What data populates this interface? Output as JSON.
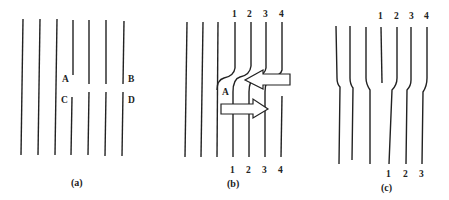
{
  "panels": [
    {
      "id": "a",
      "caption": "(a)",
      "point_labels": {
        "A": "A",
        "B": "B",
        "C": "C",
        "D": "D"
      }
    },
    {
      "id": "b",
      "caption": "(b)",
      "top_numbers": [
        "1",
        "2",
        "3",
        "4"
      ],
      "bottom_numbers": [
        "1",
        "2",
        "3",
        "4"
      ],
      "point_label": "A"
    },
    {
      "id": "c",
      "caption": "(c)",
      "top_numbers": [
        "1",
        "2",
        "3",
        "4"
      ],
      "bottom_numbers": [
        "1",
        "2",
        "3"
      ]
    }
  ],
  "colors": {
    "line": "#222222",
    "background": "#ffffff"
  }
}
